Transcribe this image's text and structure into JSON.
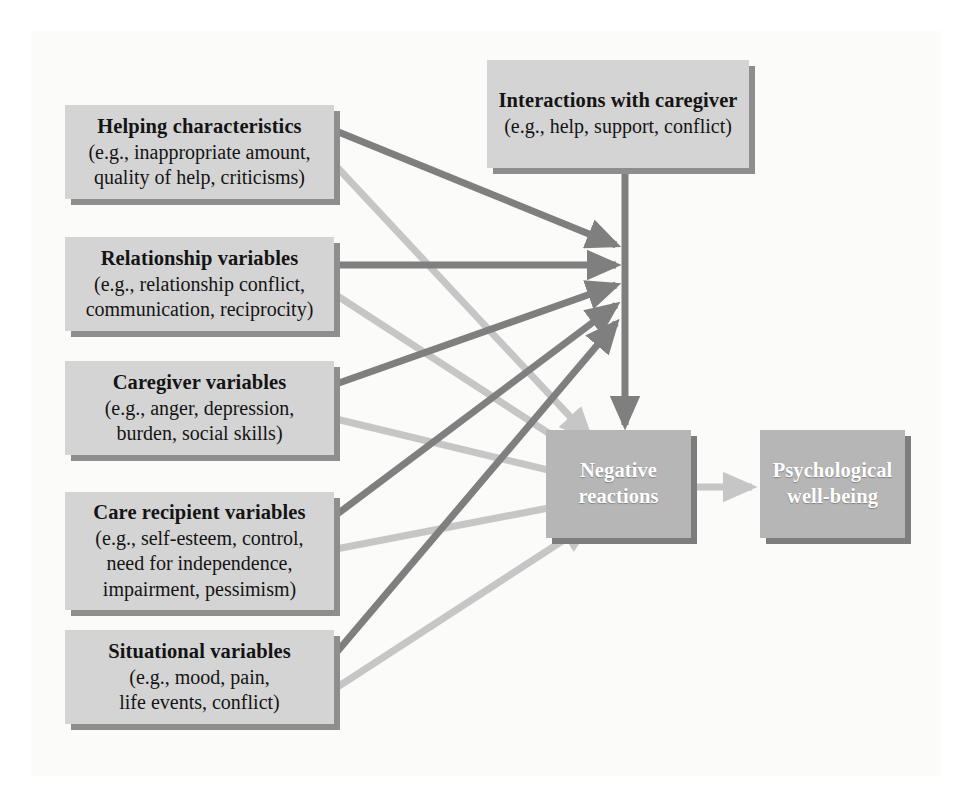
{
  "diagram": {
    "title_text": "",
    "colors": {
      "panel_background": "#fbfbfa",
      "box_light_fill": "#d4d4d4",
      "box_dark_fill": "#b6b6b6",
      "box_shadow": "#8e8e8e",
      "arrow_dark": "#7f7f7f",
      "arrow_light": "#c6c6c6",
      "text_dark": "#141414",
      "text_light": "#ffffff"
    },
    "boxes": {
      "interactions": {
        "title": "Interactions with caregiver",
        "lines": [
          "(e.g., help, support, conflict)"
        ]
      },
      "helping": {
        "title": "Helping characteristics",
        "lines": [
          "(e.g., inappropriate amount,",
          "quality of help, criticisms)"
        ]
      },
      "relationship": {
        "title": "Relationship variables",
        "lines": [
          "(e.g., relationship conflict,",
          "communication, reciprocity)"
        ]
      },
      "caregiver": {
        "title": "Caregiver variables",
        "lines": [
          "(e.g., anger, depression,",
          "burden, social skills)"
        ]
      },
      "care_recipient": {
        "title": "Care recipient variables",
        "lines": [
          "(e.g., self-esteem, control,",
          "need for independence,",
          "impairment, pessimism)"
        ]
      },
      "situational": {
        "title": "Situational variables",
        "lines": [
          "(e.g., mood, pain,",
          "life events, conflict)"
        ]
      },
      "negative_reactions": {
        "title": "Negative",
        "lines": [
          "reactions"
        ]
      },
      "psychological_wellbeing": {
        "title": "Psychological",
        "lines": [
          "well-being"
        ]
      }
    },
    "arrows": [
      {
        "name": "helping-to-interactions-moderator",
        "style": "dark"
      },
      {
        "name": "relationship-to-interactions-moderator",
        "style": "dark"
      },
      {
        "name": "caregiver-to-interactions-moderator",
        "style": "dark"
      },
      {
        "name": "care-recipient-to-interactions-moderator",
        "style": "dark"
      },
      {
        "name": "situational-to-interactions-moderator",
        "style": "dark"
      },
      {
        "name": "helping-to-negative-reactions",
        "style": "light"
      },
      {
        "name": "relationship-to-negative-reactions",
        "style": "light"
      },
      {
        "name": "caregiver-to-negative-reactions",
        "style": "light"
      },
      {
        "name": "care-recipient-to-negative-reactions",
        "style": "light"
      },
      {
        "name": "situational-to-negative-reactions",
        "style": "light"
      },
      {
        "name": "interactions-to-negative-reactions",
        "style": "dark"
      },
      {
        "name": "negative-reactions-to-psychological-well-being",
        "style": "light"
      }
    ]
  }
}
